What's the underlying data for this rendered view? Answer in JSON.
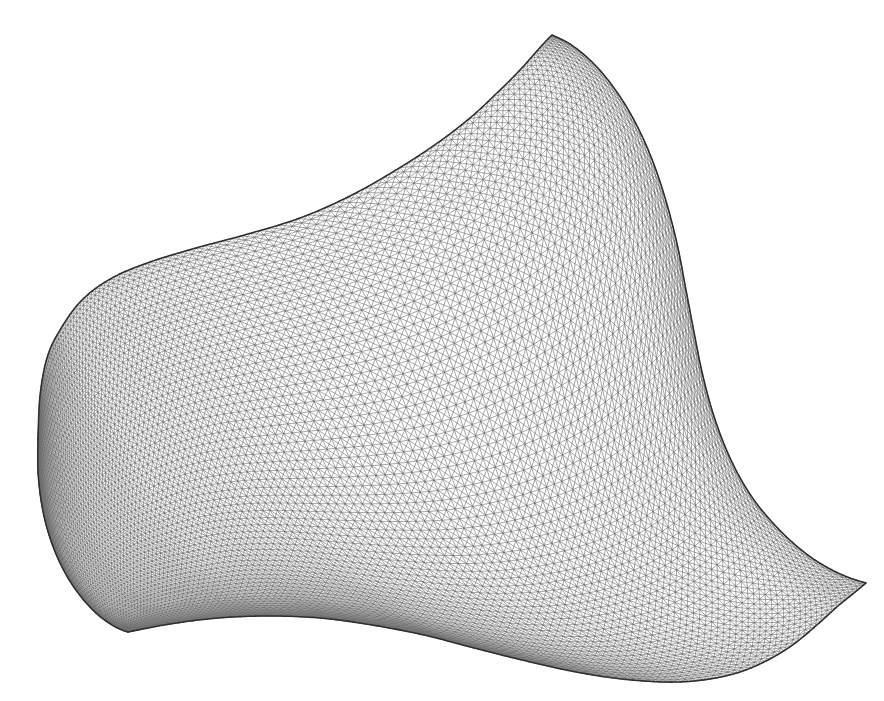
{
  "figure": {
    "title": "Triangular finite element mesh on a curved fin-shaped domain",
    "kind": "mesh-diagram",
    "canvas": {
      "width": 884,
      "height": 701
    },
    "background_color": "#ffffff"
  },
  "style": {
    "interior_line_color": "#6e6e6e",
    "interior_line_width": 0.62,
    "boundary_line_color": "#2e2e2e",
    "boundary_line_width": 1.55,
    "fill_color": "#ffffff"
  },
  "mesh": {
    "element_type": "triangle",
    "topology": "structured-quad-with-crossed-diagonals",
    "nu": 120,
    "nv": 62,
    "u_grading_exponent": 1.62,
    "v_grading_exponent": 1.0,
    "description": "Curvilinear structured grid mapped by a transfinite Coons interpolation of four boundary curves; every quadrilateral cell is split by both diagonals producing four triangles per cell.",
    "refinement_regions": [
      {
        "name": "top-spike-tip",
        "x": 552,
        "y": 35,
        "relative_density": "very-fine"
      },
      {
        "name": "bottom-left-cusp",
        "x": 128,
        "y": 632,
        "relative_density": "very-fine"
      },
      {
        "name": "right-spike-tip",
        "x": 866,
        "y": 583,
        "relative_density": "fine"
      },
      {
        "name": "left-pole",
        "x": 38,
        "y": 440,
        "relative_density": "coarse"
      }
    ]
  },
  "boundary": {
    "description": "Four boundary curves of the domain, given as cubic-Bezier polylines in pixel coordinates.",
    "corners": {
      "left_pole": {
        "x": 38,
        "y": 440
      },
      "top_spike_tip": {
        "x": 552,
        "y": 35
      },
      "right_spike_tip": {
        "x": 866,
        "y": 583
      },
      "bottom_left_cusp": {
        "x": 128,
        "y": 632
      }
    },
    "curves": {
      "top_edge": {
        "name": "upper-left boundary: left pole to top spike tip",
        "points": [
          [
            38,
            440
          ],
          [
            40,
            396
          ],
          [
            47,
            358
          ],
          [
            60,
            330
          ],
          [
            82,
            300
          ],
          [
            112,
            278
          ],
          [
            150,
            262
          ],
          [
            196,
            248
          ],
          [
            248,
            234
          ],
          [
            300,
            218
          ],
          [
            350,
            196
          ],
          [
            396,
            170
          ],
          [
            436,
            144
          ],
          [
            470,
            118
          ],
          [
            498,
            92
          ],
          [
            520,
            70
          ],
          [
            536,
            52
          ],
          [
            546,
            41
          ],
          [
            552,
            35
          ]
        ]
      },
      "right_edge": {
        "name": "right boundary: top spike tip down around notch to right spike tip",
        "points": [
          [
            552,
            35
          ],
          [
            570,
            44
          ],
          [
            590,
            60
          ],
          [
            608,
            80
          ],
          [
            626,
            106
          ],
          [
            642,
            136
          ],
          [
            656,
            170
          ],
          [
            668,
            208
          ],
          [
            678,
            248
          ],
          [
            686,
            290
          ],
          [
            694,
            332
          ],
          [
            702,
            372
          ],
          [
            712,
            410
          ],
          [
            724,
            444
          ],
          [
            738,
            474
          ],
          [
            754,
            500
          ],
          [
            772,
            522
          ],
          [
            792,
            542
          ],
          [
            812,
            558
          ],
          [
            832,
            570
          ],
          [
            850,
            578
          ],
          [
            866,
            583
          ]
        ]
      },
      "bottom_edge": {
        "name": "lower boundary: bottom-left cusp to right spike tip",
        "points": [
          [
            128,
            632
          ],
          [
            170,
            624
          ],
          [
            218,
            618
          ],
          [
            268,
            616
          ],
          [
            320,
            618
          ],
          [
            372,
            625
          ],
          [
            424,
            635
          ],
          [
            474,
            648
          ],
          [
            522,
            660
          ],
          [
            566,
            670
          ],
          [
            606,
            677
          ],
          [
            644,
            681
          ],
          [
            678,
            682
          ],
          [
            710,
            679
          ],
          [
            740,
            672
          ],
          [
            768,
            660
          ],
          [
            794,
            644
          ],
          [
            818,
            624
          ],
          [
            838,
            606
          ],
          [
            854,
            593
          ],
          [
            866,
            583
          ]
        ]
      },
      "left_edge": {
        "name": "left boundary: left pole down to bottom-left cusp",
        "points": [
          [
            38,
            440
          ],
          [
            38,
            470
          ],
          [
            41,
            500
          ],
          [
            47,
            528
          ],
          [
            56,
            554
          ],
          [
            68,
            578
          ],
          [
            82,
            598
          ],
          [
            97,
            614
          ],
          [
            112,
            625
          ],
          [
            122,
            630
          ],
          [
            128,
            632
          ]
        ]
      }
    }
  },
  "annotations": {
    "labels": [],
    "axes": null,
    "legend": null
  }
}
